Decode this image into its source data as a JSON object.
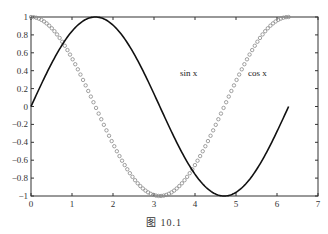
{
  "chart_data": {
    "type": "line",
    "title": "",
    "xlabel": "",
    "ylabel": "",
    "xlim": [
      0,
      7
    ],
    "ylim": [
      -1,
      1
    ],
    "grid": false,
    "x_ticks": [
      "0",
      "1",
      "2",
      "3",
      "4",
      "5",
      "6",
      "7"
    ],
    "y_ticks": [
      "1",
      "0.8",
      "0.6",
      "0.4",
      "0.2",
      "0",
      "-0.2",
      "-0.4",
      "-0.6",
      "-0.8",
      "-1"
    ],
    "series": [
      {
        "name": "sin x",
        "style": "solid line",
        "color": "#111111",
        "function": "sin(x)",
        "x_range": [
          0,
          6.2832
        ]
      },
      {
        "name": "cos x",
        "style": "circle markers",
        "color": "#888888",
        "function": "cos(x)",
        "x_range": [
          0,
          6.2832
        ],
        "points": 100
      }
    ],
    "annotations": [
      {
        "text": "sin x",
        "x": 3.6,
        "y": 0.5
      },
      {
        "text": "cos x",
        "x": 5.5,
        "y": 0.5
      }
    ]
  },
  "caption": "图   10.1",
  "labels": {
    "sin": "sin x",
    "cos": "cos x"
  }
}
